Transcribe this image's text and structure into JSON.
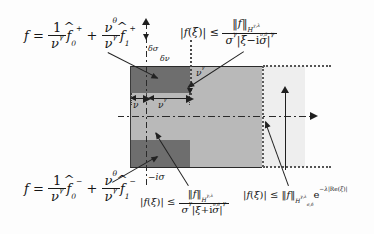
{
  "figure": {
    "type": "complex-plane-strip-diagram",
    "colors": {
      "dark_block": "#6e6e6e",
      "mid_block": "#b9b9b9",
      "outer_strip": "#eeeeee",
      "line": "#1f1f1f",
      "background": "#fdfdfd"
    }
  },
  "formulas": {
    "top_left": {
      "lhs": "f",
      "eq": "=",
      "term1_num": "1",
      "term1_den_base": "ν",
      "term1_den_exp": "γ",
      "term1_fn": "f",
      "term1_sub": "0",
      "term1_sup": "+",
      "plus": "+",
      "term2_num_base": "ν",
      "term2_num_exp": "θ",
      "term2_den_base": "ν",
      "term2_den_exp": "γ",
      "term2_fn": "f",
      "term2_sub": "1",
      "term2_sup": "+"
    },
    "bottom_left": {
      "lhs": "f",
      "eq": "=",
      "term1_num": "1",
      "term1_den_base": "ν",
      "term1_den_exp": "γ",
      "term1_fn": "f",
      "term1_sub": "0",
      "term1_sup": "−",
      "plus": "+",
      "term2_num_base": "ν",
      "term2_num_exp": "θ",
      "term2_den_base": "ν",
      "term2_den_exp": "γ",
      "term2_fn": "f",
      "term2_sub": "1",
      "term2_sup": "−"
    },
    "top_right_inequality": {
      "lhs_abs_open": "|",
      "lhs_fn": "f",
      "lhs_arg_open": "(",
      "lhs_arg": "ξ",
      "lhs_arg_close": ")",
      "lhs_abs_close": "|",
      "relation": "≤",
      "num_norm_open": "‖",
      "num_fn": "f",
      "num_norm_close": "‖",
      "num_space_base": "H",
      "num_space_sup": "γ,λ",
      "num_space_sub": "σ,δ",
      "den_sigma": "σ",
      "den_sigma_exp": "γ",
      "den_abs_open": "|",
      "den_xi": "ξ",
      "den_minus": "−",
      "den_i": "i",
      "den_sigma2": "σ",
      "den_abs_close": "|",
      "den_exp": "γ"
    },
    "bottom_middle_inequality": {
      "lhs_abs_open": "|",
      "lhs_fn": "f",
      "lhs_arg_open": "(",
      "lhs_arg": "ξ",
      "lhs_arg_close": ")",
      "lhs_abs_close": "|",
      "relation": "≤",
      "num_norm_open": "‖",
      "num_fn": "f",
      "num_norm_close": "‖",
      "num_space_base": "H",
      "num_space_sup": "γ,λ",
      "num_space_sub": "σ,δ",
      "den_sigma": "σ",
      "den_sigma_exp": "γ",
      "den_abs_open": "|",
      "den_xi": "ξ",
      "den_plus": "+",
      "den_i": "i",
      "den_sigma2": "σ",
      "den_abs_close": "|",
      "den_exp": "γ"
    },
    "bottom_right_inequality": {
      "lhs_abs_open": "|",
      "lhs_fn": "f",
      "lhs_arg_open": "(",
      "lhs_arg": "ξ",
      "lhs_arg_close": ")",
      "lhs_abs_close": "|",
      "relation": "≤",
      "norm_open": "‖",
      "norm_fn": "f",
      "norm_close": "‖",
      "space_base": "H",
      "space_sup": "γ,λ",
      "space_sub": "σ,δ",
      "exp_base": "e",
      "exp_minus": "−",
      "exp_lambda": "λ",
      "exp_abs_open": "|",
      "exp_re": "Re",
      "exp_paren_open": "(",
      "exp_xi": "ξ",
      "exp_paren_close": ")",
      "exp_abs_close": "|"
    }
  },
  "labels": {
    "delta_sigma": "δσ",
    "delta_nu": "δν",
    "nu": "ν",
    "nu_gamma_inner": "νγ",
    "nu_gamma_outer": "νγ",
    "minus_i_sigma": "−iσ"
  }
}
